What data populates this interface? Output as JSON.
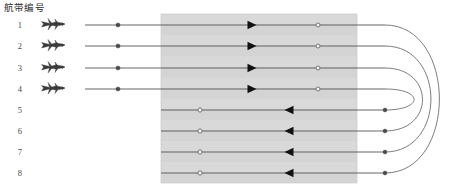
{
  "figure": {
    "title": "航带编号",
    "canvas": {
      "width": 451,
      "height": 196,
      "background": "#ffffff"
    },
    "survey_area": {
      "name": "survey-area-block",
      "x": 161,
      "y": 14,
      "width": 196,
      "height": 169,
      "fill": "#d9d9d9",
      "fill_alt": "#cfcfcf",
      "stroke": "#c4c4c4",
      "band_count": 16
    },
    "strips": [
      {
        "id": 1,
        "label": "1",
        "y": 25,
        "direction": "right",
        "has_plane": true,
        "plane_x": 40,
        "line_start_x": 85,
        "line_end_x": 385,
        "start_dot_x": 118,
        "start_dot_style": "filled",
        "arrow_x": 248,
        "turn_dot_x": 318,
        "turn_dot_style": "hollow",
        "pair_with": 8
      },
      {
        "id": 2,
        "label": "2",
        "y": 46,
        "direction": "right",
        "has_plane": true,
        "plane_x": 40,
        "line_start_x": 85,
        "line_end_x": 385,
        "start_dot_x": 118,
        "start_dot_style": "filled",
        "arrow_x": 248,
        "turn_dot_x": 318,
        "turn_dot_style": "hollow",
        "pair_with": 7
      },
      {
        "id": 3,
        "label": "3",
        "y": 68,
        "direction": "right",
        "has_plane": true,
        "plane_x": 40,
        "line_start_x": 85,
        "line_end_x": 385,
        "start_dot_x": 118,
        "start_dot_style": "filled",
        "arrow_x": 248,
        "turn_dot_x": 318,
        "turn_dot_style": "hollow",
        "pair_with": 6
      },
      {
        "id": 4,
        "label": "4",
        "y": 89,
        "direction": "right",
        "has_plane": true,
        "plane_x": 40,
        "line_start_x": 85,
        "line_end_x": 385,
        "start_dot_x": 118,
        "start_dot_style": "filled",
        "arrow_x": 248,
        "turn_dot_x": 318,
        "turn_dot_style": "hollow",
        "pair_with": 5
      },
      {
        "id": 5,
        "label": "5",
        "y": 110,
        "direction": "left",
        "has_plane": false,
        "plane_x": 40,
        "line_start_x": 161,
        "line_end_x": 385,
        "start_dot_x": 200,
        "start_dot_style": "hollow",
        "arrow_x": 293,
        "turn_dot_x": 385,
        "turn_dot_style": "filled",
        "pair_with": 4
      },
      {
        "id": 6,
        "label": "6",
        "y": 131,
        "direction": "left",
        "has_plane": false,
        "plane_x": 40,
        "line_start_x": 161,
        "line_end_x": 385,
        "start_dot_x": 200,
        "start_dot_style": "hollow",
        "arrow_x": 293,
        "turn_dot_x": 385,
        "turn_dot_style": "filled",
        "pair_with": 3
      },
      {
        "id": 7,
        "label": "7",
        "y": 152,
        "direction": "left",
        "has_plane": false,
        "plane_x": 40,
        "line_start_x": 161,
        "line_end_x": 385,
        "start_dot_x": 200,
        "start_dot_style": "hollow",
        "arrow_x": 293,
        "turn_dot_x": 385,
        "turn_dot_style": "filled",
        "pair_with": 2
      },
      {
        "id": 8,
        "label": "8",
        "y": 173,
        "direction": "left",
        "has_plane": false,
        "plane_x": 40,
        "line_start_x": 161,
        "line_end_x": 385,
        "start_dot_x": 200,
        "start_dot_style": "hollow",
        "arrow_x": 293,
        "turn_dot_x": 385,
        "turn_dot_style": "filled",
        "pair_with": 1
      }
    ],
    "turn_curves": [
      {
        "name": "turn-curve-1-8",
        "from_strip": 1,
        "to_strip": 8,
        "from_y": 25,
        "to_y": 173,
        "apex_x": 443
      },
      {
        "name": "turn-curve-2-7",
        "from_strip": 2,
        "to_strip": 7,
        "from_y": 46,
        "to_y": 152,
        "apex_x": 434
      },
      {
        "name": "turn-curve-3-6",
        "from_strip": 3,
        "to_strip": 6,
        "from_y": 68,
        "to_y": 131,
        "apex_x": 425
      },
      {
        "name": "turn-curve-4-5",
        "from_strip": 4,
        "to_strip": 5,
        "from_y": 89,
        "to_y": 110,
        "apex_x": 416
      }
    ],
    "colors": {
      "line": "#555555",
      "dot_fill": "#4a4a4a",
      "dot_hollow_stroke": "#6b6b6b",
      "dot_hollow_fill": "#f2f2f2",
      "arrow": "#111111",
      "curve": "#666666",
      "plane": "#3b3b3b",
      "text": "#2e2e2e"
    },
    "label_x": 22,
    "plane_icon_name": "airplane-icon"
  }
}
